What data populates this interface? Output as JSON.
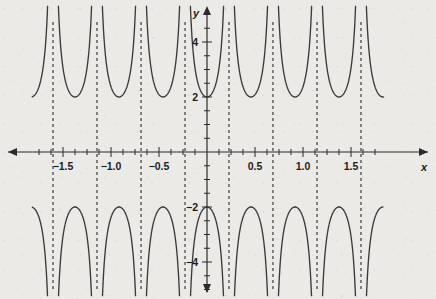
{
  "figure": {
    "background_color": "#eceae6",
    "curve_color": "#3a3a3a",
    "axis_color": "#2b2b2b",
    "asymptote_color": "#2b2b2b"
  },
  "axes": {
    "x_axis_label": "x",
    "y_axis_label": "y",
    "x_ticks_labeled": [
      {
        "value": -1.5,
        "label": "−1.5"
      },
      {
        "value": -1.0,
        "label": "−1.0"
      },
      {
        "value": -0.5,
        "label": "−0.5"
      },
      {
        "value": 0.5,
        "label": "0.5"
      },
      {
        "value": 1.0,
        "label": "1.0"
      },
      {
        "value": 1.5,
        "label": "1.5"
      }
    ],
    "y_ticks_labeled": [
      {
        "value": 4,
        "label": "4"
      },
      {
        "value": 2,
        "label": "2"
      },
      {
        "value": -2,
        "label": "−2"
      },
      {
        "value": -4,
        "label": "−4"
      }
    ],
    "x_minor_tick_step": 0.125,
    "y_minor_tick_step": 0.5,
    "xlim": [
      -1.82,
      1.84
    ],
    "ylim": [
      -5.3,
      5.3
    ],
    "grid": false,
    "arrowheads": [
      "left",
      "right",
      "up",
      "down"
    ]
  },
  "chart_data": {
    "type": "line",
    "title": "",
    "xlabel": "x",
    "ylabel": "y",
    "grid": false,
    "legend": "none",
    "function": "y = 2·sec(2πx/0.9167)",
    "amplitude": 2,
    "period": 0.9167,
    "xlim": [
      -1.82,
      1.84
    ],
    "ylim": [
      -5.3,
      5.3
    ],
    "categories": [],
    "values": [],
    "asymptotes_x": [
      -1.604,
      -1.146,
      -0.687,
      -0.229,
      0.229,
      0.687,
      1.146,
      1.604
    ],
    "local_minima": [
      {
        "x": -1.375,
        "y": 2
      },
      {
        "x": -0.458,
        "y": 2
      },
      {
        "x": 0.458,
        "y": 2
      },
      {
        "x": 1.375,
        "y": 2
      }
    ],
    "local_maxima": [
      {
        "x": -0.917,
        "y": -2
      },
      {
        "x": 0.0,
        "y": -2
      },
      {
        "x": 0.917,
        "y": -2
      }
    ],
    "series": [
      {
        "name": "y = 2 sec(2πx/0.9167)",
        "branches_up": [
          {
            "center_x": -1.375,
            "min_y": 2
          },
          {
            "center_x": -0.458,
            "min_y": 2
          },
          {
            "center_x": 0.458,
            "min_y": 2
          },
          {
            "center_x": 1.375,
            "min_y": 2
          }
        ],
        "branches_down": [
          {
            "center_x": -1.833,
            "max_y": -2
          },
          {
            "center_x": -0.917,
            "max_y": -2
          },
          {
            "center_x": 0.0,
            "max_y": -2
          },
          {
            "center_x": 0.917,
            "max_y": -2
          },
          {
            "center_x": 1.833,
            "max_y": -2
          }
        ]
      }
    ]
  },
  "geometry": {
    "origin_px": {
      "x": 207,
      "y": 152
    },
    "x_unit_px": 96,
    "y_unit_px": 27.5
  }
}
